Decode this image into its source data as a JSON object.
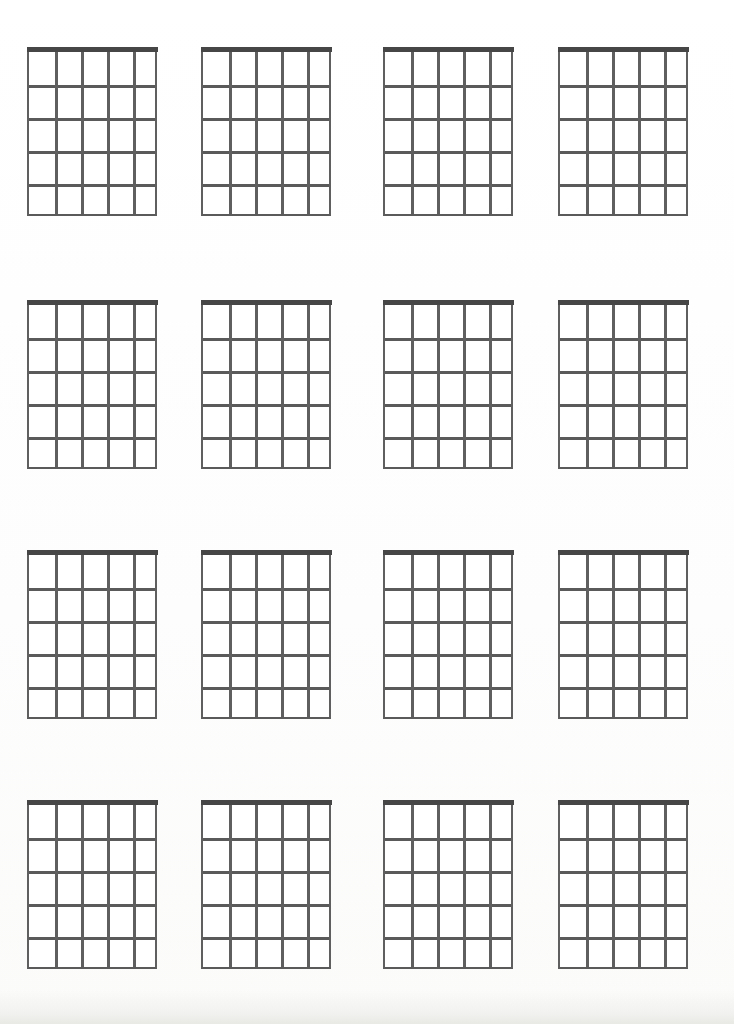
{
  "document": {
    "kind": "blank-guitar-chord-chart-worksheet",
    "title": "Blank Guitar Chord Diagram Sheet",
    "page_width": 734,
    "page_height": 1024,
    "background_color": "#ffffff",
    "text_content": "",
    "visible_labels": []
  },
  "style": {
    "nut_color": "#464646",
    "fret_color": "#5a5a5a",
    "string_color": "#5f5f5f",
    "paper_color": "#fefefe",
    "nut_thickness_px": 5.5,
    "line_thickness_px": 2.5
  },
  "layout": {
    "rows": 4,
    "columns": 4,
    "diagram_count": 16,
    "row_tops": [
      52,
      305,
      555,
      805
    ],
    "column_lefts": [
      27,
      201,
      383,
      558
    ],
    "diagram_width": 130,
    "diagram_height": 164
  },
  "diagram_template": {
    "strings": 6,
    "string_spaces": 5,
    "frets": 5,
    "has_nut": true,
    "has_labels": false,
    "has_finger_dots": false,
    "fret_y_offsets": [
      33,
      66,
      99,
      132
    ],
    "string_x_offsets": [
      26,
      52,
      78,
      104
    ]
  },
  "diagrams": [
    {
      "id": "chord-diagram-1",
      "row": 1,
      "col": 1,
      "left": 27,
      "top": 52,
      "label": ""
    },
    {
      "id": "chord-diagram-2",
      "row": 1,
      "col": 2,
      "left": 201,
      "top": 52,
      "label": ""
    },
    {
      "id": "chord-diagram-3",
      "row": 1,
      "col": 3,
      "left": 383,
      "top": 52,
      "label": ""
    },
    {
      "id": "chord-diagram-4",
      "row": 1,
      "col": 4,
      "left": 558,
      "top": 52,
      "label": ""
    },
    {
      "id": "chord-diagram-5",
      "row": 2,
      "col": 1,
      "left": 27,
      "top": 305,
      "label": ""
    },
    {
      "id": "chord-diagram-6",
      "row": 2,
      "col": 2,
      "left": 201,
      "top": 305,
      "label": ""
    },
    {
      "id": "chord-diagram-7",
      "row": 2,
      "col": 3,
      "left": 383,
      "top": 305,
      "label": ""
    },
    {
      "id": "chord-diagram-8",
      "row": 2,
      "col": 4,
      "left": 558,
      "top": 305,
      "label": ""
    },
    {
      "id": "chord-diagram-9",
      "row": 3,
      "col": 1,
      "left": 27,
      "top": 555,
      "label": ""
    },
    {
      "id": "chord-diagram-10",
      "row": 3,
      "col": 2,
      "left": 201,
      "top": 555,
      "label": ""
    },
    {
      "id": "chord-diagram-11",
      "row": 3,
      "col": 3,
      "left": 383,
      "top": 555,
      "label": ""
    },
    {
      "id": "chord-diagram-12",
      "row": 3,
      "col": 4,
      "left": 558,
      "top": 555,
      "label": ""
    },
    {
      "id": "chord-diagram-13",
      "row": 4,
      "col": 1,
      "left": 27,
      "top": 805,
      "label": ""
    },
    {
      "id": "chord-diagram-14",
      "row": 4,
      "col": 2,
      "left": 201,
      "top": 805,
      "label": ""
    },
    {
      "id": "chord-diagram-15",
      "row": 4,
      "col": 3,
      "left": 383,
      "top": 805,
      "label": ""
    },
    {
      "id": "chord-diagram-16",
      "row": 4,
      "col": 4,
      "left": 558,
      "top": 805,
      "label": ""
    }
  ]
}
